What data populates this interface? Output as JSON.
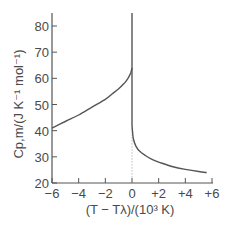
{
  "chart_data": {
    "type": "line",
    "title": "",
    "xlabel": "(T − Tλ)/(10³ K)",
    "ylabel": "Cp,m/(J K⁻¹ mol⁻¹)",
    "xlim": [
      -6,
      6
    ],
    "ylim": [
      20,
      85
    ],
    "grid": false,
    "legend": null,
    "x_ticks": [
      -6,
      -4,
      -2,
      0,
      2,
      4,
      6
    ],
    "x_tick_labels": [
      "−6",
      "−4",
      "−2",
      "0",
      "+2",
      "+4",
      "+6"
    ],
    "y_ticks": [
      20,
      30,
      40,
      50,
      60,
      70,
      80
    ],
    "y_tick_labels": [
      "20",
      "30",
      "40",
      "50",
      "60",
      "70",
      "80"
    ],
    "annotations": [
      "dotted vertical line at T = Tλ (x = 0)"
    ],
    "series": [
      {
        "name": "below lambda point",
        "x": [
          -6,
          -5,
          -4,
          -3,
          -2,
          -1.5,
          -1,
          -0.6,
          -0.3,
          -0.1,
          0
        ],
        "y": [
          41,
          43.5,
          46,
          49,
          52,
          54,
          56,
          58,
          60,
          62,
          64
        ]
      },
      {
        "name": "lambda spike",
        "x": [
          0,
          0
        ],
        "y": [
          85,
          42
        ]
      },
      {
        "name": "above lambda point",
        "x": [
          0,
          0.1,
          0.3,
          0.6,
          1,
          1.5,
          2,
          3,
          4,
          5,
          5.6
        ],
        "y": [
          42,
          37,
          34,
          32,
          30.5,
          29,
          28,
          26.3,
          25.2,
          24.4,
          24
        ]
      }
    ],
    "colors": {
      "curve": "#555555",
      "axis": "#555555",
      "dotted": "#999999",
      "text": "#4a4a4a"
    }
  }
}
